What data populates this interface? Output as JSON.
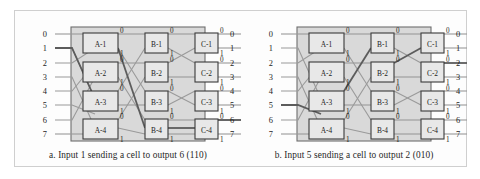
{
  "figure": {
    "kind": "banyan-switching-fabric",
    "panels": [
      {
        "id": "a",
        "caption": "a. Input 1 sending a cell to output 6 (110)",
        "active_input": 1,
        "active_output": 6,
        "routing_bits": "110",
        "active_path_switches": [
          "A-1",
          "B-4",
          "C-4"
        ],
        "inputs": [
          "0",
          "1",
          "2",
          "3",
          "4",
          "5",
          "6",
          "7"
        ],
        "outputs": [
          "0",
          "1",
          "2",
          "3",
          "4",
          "5",
          "6",
          "7"
        ],
        "stages": [
          {
            "name": "A",
            "switches": [
              "A-1",
              "A-2",
              "A-3",
              "A-4"
            ]
          },
          {
            "name": "B",
            "switches": [
              "B-1",
              "B-2",
              "B-3",
              "B-4"
            ]
          },
          {
            "name": "C",
            "switches": [
              "C-1",
              "C-2",
              "C-3",
              "C-4"
            ]
          }
        ],
        "port_labels": [
          "0",
          "1"
        ]
      },
      {
        "id": "b",
        "caption": "b. Input 5 sending a cell to output 2 (010)",
        "active_input": 5,
        "active_output": 2,
        "routing_bits": "010",
        "active_path_switches": [
          "A-3",
          "B-2",
          "C-2"
        ],
        "inputs": [
          "0",
          "1",
          "2",
          "3",
          "4",
          "5",
          "6",
          "7"
        ],
        "outputs": [
          "0",
          "1",
          "2",
          "3",
          "4",
          "5",
          "6",
          "7"
        ],
        "stages": [
          {
            "name": "A",
            "switches": [
              "A-1",
              "A-2",
              "A-3",
              "A-4"
            ]
          },
          {
            "name": "B",
            "switches": [
              "B-1",
              "B-2",
              "B-3",
              "B-4"
            ]
          },
          {
            "name": "C",
            "switches": [
              "C-1",
              "C-2",
              "C-3",
              "C-4"
            ]
          }
        ],
        "port_labels": [
          "0",
          "1"
        ]
      }
    ]
  },
  "colors": {
    "page_background": "#ffffff",
    "frame_border": "#cfcfcf",
    "fabric_fill": "#d9d9d9",
    "fabric_border": "#6e6e6e",
    "switch_fill": "#e8e8e8",
    "switch_border": "#3a3a3a",
    "wire": "#9a9a9a",
    "active_wire": "#5c5c5c",
    "text": "#1d1d1d"
  }
}
